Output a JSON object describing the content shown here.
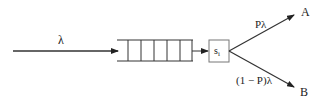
{
  "diagram": {
    "type": "queueing-system",
    "input": {
      "label": "λ"
    },
    "queue": {
      "cells": 6
    },
    "server": {
      "label_base": "s",
      "label_sub": "i"
    },
    "outputs": [
      {
        "dest_label": "A",
        "rate_label": "Pλ"
      },
      {
        "dest_label": "B",
        "rate_label": "(1 − P)λ"
      }
    ],
    "colors": {
      "line": "#222222",
      "server_border": "#777777"
    }
  }
}
